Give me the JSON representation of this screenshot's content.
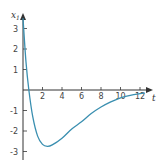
{
  "chart_data": {
    "type": "line",
    "title": "",
    "xlabel": "t",
    "ylabel": "x₁",
    "ylabel_main": "x",
    "ylabel_sub": "1",
    "xlim": [
      0,
      13
    ],
    "ylim": [
      -3.3,
      3.7
    ],
    "grid": false,
    "legend": null,
    "x_ticks": [
      2,
      4,
      6,
      8,
      10,
      12
    ],
    "x_tick_labels": [
      "2",
      "4",
      "6",
      "8",
      "10",
      "12"
    ],
    "y_ticks": [
      3,
      2,
      1,
      -1,
      -2,
      -3
    ],
    "y_tick_labels": [
      "3",
      "2",
      "1",
      "-1",
      "-2",
      "-3"
    ],
    "series": [
      {
        "name": "x1(t)",
        "color": "#3a8fb0",
        "x": [
          0,
          0.3,
          0.6,
          1.0,
          1.5,
          2.0,
          2.5,
          3.0,
          4.0,
          5.0,
          6.0,
          7.0,
          8.0,
          9.0,
          10.0,
          11.0,
          12.0,
          12.5
        ],
        "y": [
          3.5,
          1.4,
          0.0,
          -1.3,
          -2.25,
          -2.65,
          -2.75,
          -2.68,
          -2.35,
          -1.9,
          -1.55,
          -1.15,
          -0.83,
          -0.58,
          -0.38,
          -0.26,
          -0.18,
          -0.15
        ]
      }
    ]
  },
  "colors": {
    "axis": "#333333",
    "curve": "#3a8fb0"
  }
}
